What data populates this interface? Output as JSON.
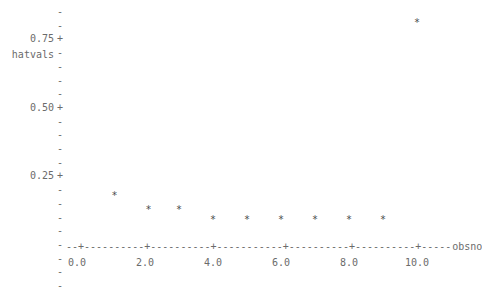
{
  "chart_data": {
    "type": "scatter",
    "title": "",
    "subtitle": "",
    "xlabel": "obsno",
    "ylabel": "hatvals",
    "marker": "*",
    "grid": false,
    "legend": null,
    "xlim": [
      -0.3,
      11.2
    ],
    "ylim": [
      0.0,
      0.9
    ],
    "xticks": [
      0.0,
      2.0,
      4.0,
      6.0,
      8.0,
      10.0
    ],
    "xtick_labels": [
      "0.0",
      "2.0",
      "4.0",
      "6.0",
      "8.0",
      "10.0"
    ],
    "yticks": [
      0.25,
      0.5,
      0.75
    ],
    "ytick_labels": [
      "0.25+",
      "0.50+",
      "0.75+"
    ],
    "y_minor_tick_count": 21,
    "x": [
      1.1,
      2.1,
      3.0,
      4.0,
      5.0,
      6.0,
      7.0,
      8.0,
      9.0,
      10.0
    ],
    "y": [
      0.176,
      0.125,
      0.125,
      0.089,
      0.089,
      0.089,
      0.089,
      0.089,
      0.089,
      0.81
    ],
    "points": [
      {
        "obsno": 1.1,
        "hatval": 0.176
      },
      {
        "obsno": 2.1,
        "hatval": 0.125
      },
      {
        "obsno": 3.0,
        "hatval": 0.125
      },
      {
        "obsno": 4.0,
        "hatval": 0.089
      },
      {
        "obsno": 5.0,
        "hatval": 0.089
      },
      {
        "obsno": 6.0,
        "hatval": 0.089
      },
      {
        "obsno": 7.0,
        "hatval": 0.089
      },
      {
        "obsno": 8.0,
        "hatval": 0.089
      },
      {
        "obsno": 9.0,
        "hatval": 0.089
      },
      {
        "obsno": 10.0,
        "hatval": 0.81
      }
    ],
    "axis_color": "#6b6b6b",
    "point_color": "#4a4a4a",
    "background_color": "#ffffff"
  },
  "axes": {
    "y_title": "hatvals",
    "x_title": "obsno",
    "y_tick_glyph": "-",
    "y_tick_label_glyph": "+",
    "x_tick_glyph": "+",
    "x_line_glyph": "-"
  }
}
